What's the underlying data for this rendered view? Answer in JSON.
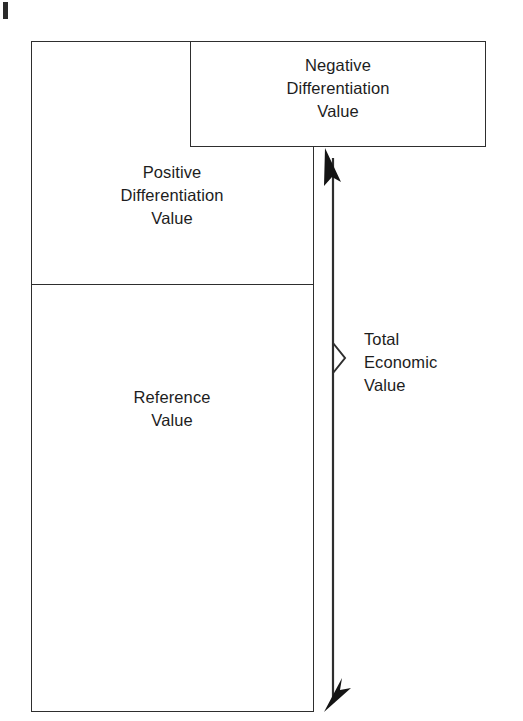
{
  "figure": {
    "type": "value-stack-diagram",
    "title_visible": false,
    "background_color": "#ffffff",
    "line_color": "#2e2e2e",
    "text_color": "#1d1d1d"
  },
  "blocks": {
    "negative_differentiation": {
      "label": "Negative\nDifferentiation\nValue",
      "x": 190,
      "y": 41,
      "width": 296,
      "height": 106
    },
    "positive_differentiation": {
      "label": "Positive\nDifferentiation\nValue",
      "x": 31,
      "y": 41,
      "width": 283,
      "height": 244
    },
    "reference": {
      "label": "Reference\nValue",
      "x": 31,
      "y": 285,
      "width": 283,
      "height": 427
    }
  },
  "annotation": {
    "total_economic_value": {
      "label": "Total\nEconomic\nValue",
      "bracket_marker": "chevron-right",
      "measure_from_y": 150,
      "measure_to_y": 711
    }
  },
  "marks": {
    "page_margin_tick": "|"
  }
}
